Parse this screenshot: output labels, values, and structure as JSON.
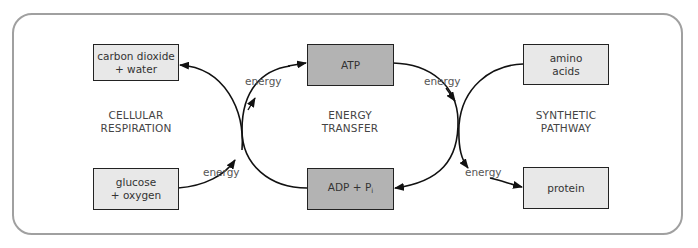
{
  "diagram": {
    "title": "",
    "sections": [
      {
        "id": "cellular-respiration",
        "line1": "CELLULAR",
        "line2": "RESPIRATION"
      },
      {
        "id": "energy-transfer",
        "line1": "ENERGY",
        "line2": "TRANSFER"
      },
      {
        "id": "synthetic-pathway",
        "line1": "SYNTHETIC",
        "line2": "PATHWAY"
      }
    ],
    "nodes": {
      "carbon_dioxide": {
        "line1": "carbon dioxide",
        "line2": "+ water"
      },
      "glucose": {
        "line1": "glucose",
        "line2": "+ oxygen"
      },
      "atp": {
        "label": "ATP"
      },
      "adp": {
        "label": "ADP + P",
        "subscript": "i"
      },
      "amino_acids": {
        "line1": "amino",
        "line2": "acids"
      },
      "protein": {
        "label": "protein"
      }
    },
    "edge_labels": {
      "e1": "energy",
      "e2": "energy",
      "e3": "energy",
      "e4": "energy"
    },
    "edges": [
      {
        "from": "glucose + oxygen",
        "to": "carbon dioxide + water",
        "label": "energy"
      },
      {
        "from": "ADP + Pi",
        "to": "ATP",
        "label": "energy"
      },
      {
        "from": "ATP",
        "to": "ADP + Pi",
        "label": "energy"
      },
      {
        "from": "amino acids",
        "to": "protein",
        "label": "energy"
      }
    ],
    "colors": {
      "frame": "#a0a0a0",
      "box_light": "#e8e8e8",
      "box_dark": "#b3b3b3",
      "stroke": "#111111"
    }
  }
}
